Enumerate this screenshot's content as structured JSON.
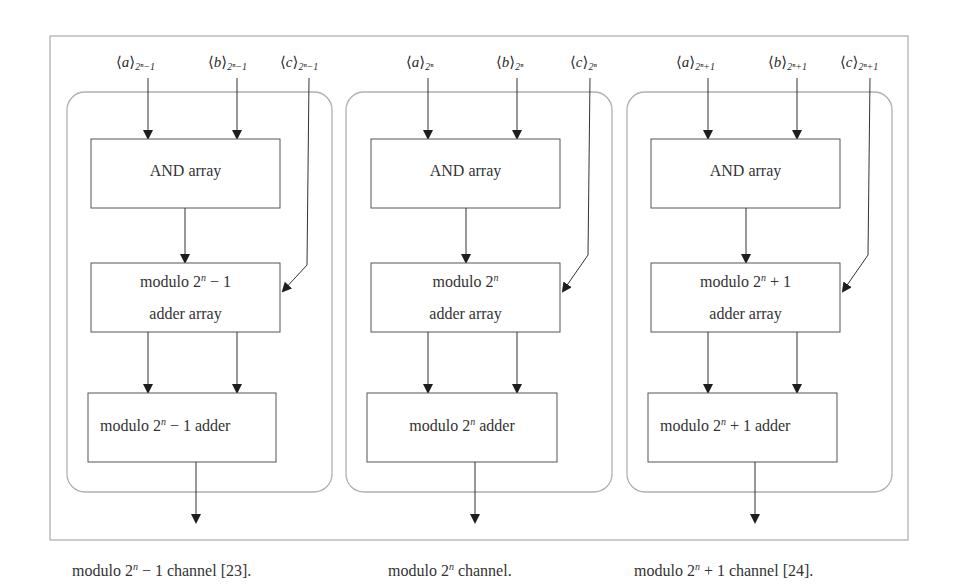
{
  "figure": {
    "channels": [
      {
        "id": "minus",
        "inputs": {
          "a": {
            "var": "a",
            "modulus": "2ⁿ−1"
          },
          "b": {
            "var": "b",
            "modulus": "2ⁿ−1"
          },
          "c": {
            "var": "c",
            "modulus": "2ⁿ−1"
          }
        },
        "and_block": "AND array",
        "adder_array": {
          "line1_prefix": "modulo 2",
          "exp": "n",
          "line1_suffix": " − 1",
          "line2": "adder array"
        },
        "final_adder": {
          "prefix": "modulo 2",
          "exp": "n",
          "suffix": " − 1 adder"
        },
        "caption": {
          "prefix": "modulo 2",
          "exp": "n",
          "suffix": " − 1 channel [23]."
        }
      },
      {
        "id": "plain",
        "inputs": {
          "a": {
            "var": "a",
            "modulus": "2ⁿ"
          },
          "b": {
            "var": "b",
            "modulus": "2ⁿ"
          },
          "c": {
            "var": "c",
            "modulus": "2ⁿ"
          }
        },
        "and_block": "AND array",
        "adder_array": {
          "line1_prefix": "modulo 2",
          "exp": "n",
          "line1_suffix": "",
          "line2": "adder array"
        },
        "final_adder": {
          "prefix": "modulo 2",
          "exp": "n",
          "suffix": " adder"
        },
        "caption": {
          "prefix": "modulo 2",
          "exp": "n",
          "suffix": " channel."
        }
      },
      {
        "id": "plus",
        "inputs": {
          "a": {
            "var": "a",
            "modulus": "2ⁿ+1"
          },
          "b": {
            "var": "b",
            "modulus": "2ⁿ+1"
          },
          "c": {
            "var": "c",
            "modulus": "2ⁿ+1"
          }
        },
        "and_block": "AND array",
        "adder_array": {
          "line1_prefix": "modulo 2",
          "exp": "n",
          "line1_suffix": " + 1",
          "line2": "adder array"
        },
        "final_adder": {
          "prefix": "modulo 2",
          "exp": "n",
          "suffix": " + 1 adder"
        },
        "caption": {
          "prefix": "modulo 2",
          "exp": "n",
          "suffix": " + 1 channel [24]."
        }
      }
    ],
    "colors": {
      "frame": "#9a9a9a",
      "channel_border": "#b0b0b0",
      "block_border": "#555555",
      "arrow": "#222222",
      "text": "#2a2a2a"
    }
  }
}
